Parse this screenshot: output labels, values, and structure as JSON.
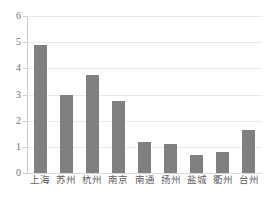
{
  "chart_data": {
    "type": "bar",
    "title": "",
    "subtitle": "",
    "xlabel": "",
    "ylabel": "",
    "categories": [
      "上海",
      "苏州",
      "杭州",
      "南京",
      "南通",
      "扬州",
      "盐城",
      "衢州",
      "台州"
    ],
    "values": [
      4.9,
      3.0,
      3.75,
      2.75,
      1.2,
      1.1,
      0.7,
      0.8,
      1.65
    ],
    "series": [
      {
        "name": "",
        "values": [
          4.9,
          3.0,
          3.75,
          2.75,
          1.2,
          1.1,
          0.7,
          0.8,
          1.65
        ]
      }
    ],
    "ylim": [
      0,
      6
    ],
    "yticks": [
      0,
      1,
      2,
      3,
      4,
      5,
      6
    ],
    "ytick_labels": [
      "0",
      "1",
      "2",
      "3",
      "4",
      "5",
      "6"
    ],
    "grid": true,
    "grid_axis": "y",
    "legend": false,
    "legend_position": "none",
    "bar_color": "#808080",
    "gridline_color": "#e9e9e9",
    "axis_color": "#c9c9c9",
    "tick_label_color": "#6e6e6e",
    "background_color": "#ffffff"
  }
}
